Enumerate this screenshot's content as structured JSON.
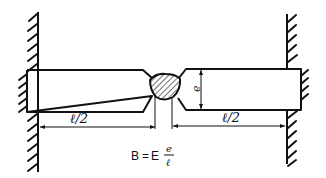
{
  "diagram": {
    "type": "welded-bar-between-fixed-walls",
    "labels": {
      "thickness": "e",
      "left_half_length": "ℓ/2",
      "right_half_length": "ℓ/2"
    },
    "formula": {
      "lhs": "B",
      "equals": "=",
      "coef": "E",
      "numerator": "e",
      "denominator": "ℓ"
    },
    "colors": {
      "stroke": "#111111",
      "background": "#ffffff"
    }
  }
}
